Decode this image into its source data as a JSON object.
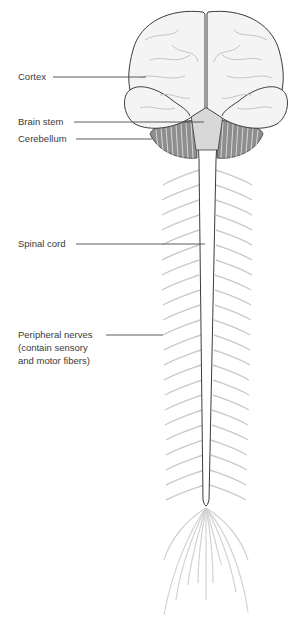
{
  "diagram": {
    "labels": {
      "cortex": "Cortex",
      "brain_stem": "Brain stem",
      "cerebellum": "Cerebellum",
      "spinal_cord": "Spinal cord",
      "peripheral_line1": "Peripheral nerves",
      "peripheral_line2": "(contain sensory",
      "peripheral_line3": "and motor fibers)"
    },
    "colors": {
      "outline": "#3c3c3c",
      "nerve": "#c8c8c8",
      "leader_line": "#4a4a4a",
      "brain_fill": "#f4f4f4"
    }
  }
}
